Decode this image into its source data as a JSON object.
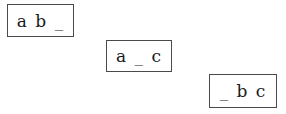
{
  "boxes": [
    {
      "label": "a b _"
    },
    {
      "label": "a _ c"
    },
    {
      "label": "_ b c"
    }
  ]
}
